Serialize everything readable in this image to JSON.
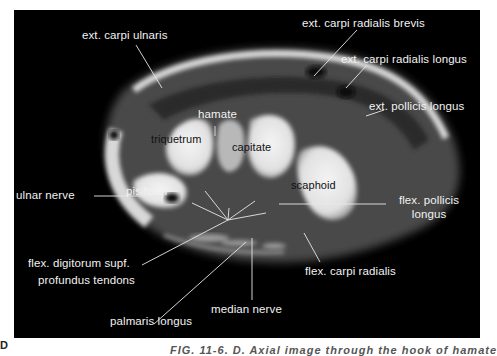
{
  "figure": {
    "panel_letter": "D",
    "caption_partial": "FIG. 11-6. D. Axial image through the hook of hamate",
    "background_color": "#000000",
    "label_color": "#f2f2f2"
  },
  "labels": {
    "ext_carpi_ulnaris": "ext. carpi  ulnaris",
    "ext_carpi_radialis_brevis": "ext. carpi radialis brevis",
    "ext_carpi_radialis_longus": "ext. carpi  radialis longus",
    "ext_pollicis_longus": "ext. pollicis longus",
    "hamate": "hamate",
    "triquetrum": "triquetrum",
    "capitate": "capitate",
    "scaphoid": "scaphoid",
    "pisiform": "pisiform",
    "ulnar_nerve": "ulnar  nerve",
    "flex_pollicis_longus_line1": "flex. pollicis",
    "flex_pollicis_longus_line2": "longus",
    "flex_digitorum_line1": "flex. digitorum supf.",
    "flex_digitorum_line2": "profundus  tendons",
    "flex_carpi_radialis": "flex. carpi radialis",
    "median_nerve": "median  nerve",
    "palmaris_longus": "palmaris longus"
  }
}
